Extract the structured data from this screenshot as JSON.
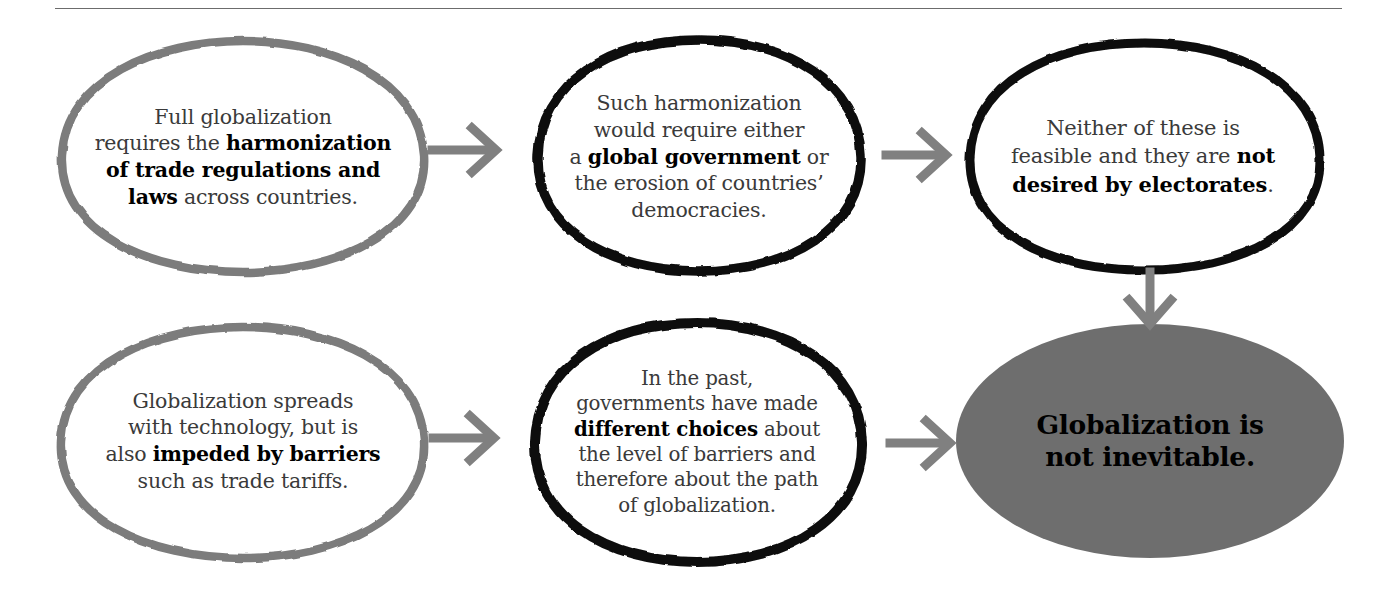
{
  "page": {
    "title": "Globalization is not inevitable — flow diagram",
    "background_color": "#ffffff",
    "divider_color": "#6c6c6c"
  },
  "colors": {
    "ellipse_gray_stroke": "#7b7b7b",
    "ellipse_black_stroke": "#000000",
    "ellipse_gray_fill": "#6e6e6e",
    "arrow_gray": "#808080",
    "body_text": "#3a3a3a",
    "bold_text": "#000000"
  },
  "nodes": [
    {
      "id": "node-1",
      "position": "top-left",
      "stroke_style": "gray-outline",
      "fill": "none",
      "text_plain": "Full globalization requires the harmonization of trade regulations and laws across countries.",
      "lines": [
        [
          {
            "t": "Full globalization",
            "b": false
          }
        ],
        [
          {
            "t": "requires the ",
            "b": false
          },
          {
            "t": "harmonization",
            "b": true
          }
        ],
        [
          {
            "t": "of trade regulations and",
            "b": true
          }
        ],
        [
          {
            "t": "laws",
            "b": true
          },
          {
            "t": " across countries.",
            "b": false
          }
        ]
      ]
    },
    {
      "id": "node-2",
      "position": "top-center",
      "stroke_style": "black-outline",
      "fill": "none",
      "text_plain": "Such harmonization would require either a global government or the erosion of countries' democracies.",
      "lines": [
        [
          {
            "t": "Such harmonization",
            "b": false
          }
        ],
        [
          {
            "t": "would require either",
            "b": false
          }
        ],
        [
          {
            "t": "a ",
            "b": false
          },
          {
            "t": "global government",
            "b": true
          },
          {
            "t": " or",
            "b": false
          }
        ],
        [
          {
            "t": "the erosion of countries’",
            "b": false
          }
        ],
        [
          {
            "t": "democracies.",
            "b": false
          }
        ]
      ]
    },
    {
      "id": "node-3",
      "position": "top-right",
      "stroke_style": "black-outline",
      "fill": "none",
      "text_plain": "Neither of these is feasible and they are not desired by electorates.",
      "lines": [
        [
          {
            "t": "Neither of these is",
            "b": false
          }
        ],
        [
          {
            "t": "feasible and they are ",
            "b": false
          },
          {
            "t": "not",
            "b": true
          }
        ],
        [
          {
            "t": "desired by electorates",
            "b": true
          },
          {
            "t": ".",
            "b": false
          }
        ]
      ]
    },
    {
      "id": "node-4",
      "position": "bottom-left",
      "stroke_style": "gray-outline",
      "fill": "none",
      "text_plain": "Globalization spreads with technology, but is also impeded by barriers such as trade tariffs.",
      "lines": [
        [
          {
            "t": "Globalization spreads",
            "b": false
          }
        ],
        [
          {
            "t": "with technology, but is",
            "b": false
          }
        ],
        [
          {
            "t": "also ",
            "b": false
          },
          {
            "t": "impeded by barriers",
            "b": true
          }
        ],
        [
          {
            "t": "such as trade tariffs.",
            "b": false
          }
        ]
      ]
    },
    {
      "id": "node-5",
      "position": "bottom-center",
      "stroke_style": "black-outline",
      "fill": "none",
      "text_plain": "In the past, governments have made different choices about the level of barriers and therefore about the path of globalization.",
      "lines": [
        [
          {
            "t": "In the past,",
            "b": false
          }
        ],
        [
          {
            "t": "governments have made",
            "b": false
          }
        ],
        [
          {
            "t": "different choices",
            "b": true
          },
          {
            "t": " about",
            "b": false
          }
        ],
        [
          {
            "t": "the level of barriers and",
            "b": false
          }
        ],
        [
          {
            "t": "therefore about the path",
            "b": false
          }
        ],
        [
          {
            "t": "of globalization.",
            "b": false
          }
        ]
      ]
    },
    {
      "id": "node-6",
      "position": "bottom-right",
      "stroke_style": "none",
      "fill": "gray",
      "text_plain": "Globalization is not inevitable.",
      "lines": [
        [
          {
            "t": "Globalization is",
            "b": true
          }
        ],
        [
          {
            "t": "not inevitable.",
            "b": true
          }
        ]
      ]
    }
  ],
  "arrows": [
    {
      "id": "arrow-1-to-2",
      "from": "node-1",
      "to": "node-2",
      "direction": "right"
    },
    {
      "id": "arrow-2-to-3",
      "from": "node-2",
      "to": "node-3",
      "direction": "right"
    },
    {
      "id": "arrow-3-to-6",
      "from": "node-3",
      "to": "node-6",
      "direction": "down"
    },
    {
      "id": "arrow-4-to-5",
      "from": "node-4",
      "to": "node-5",
      "direction": "right"
    },
    {
      "id": "arrow-5-to-6",
      "from": "node-5",
      "to": "node-6",
      "direction": "right"
    }
  ]
}
